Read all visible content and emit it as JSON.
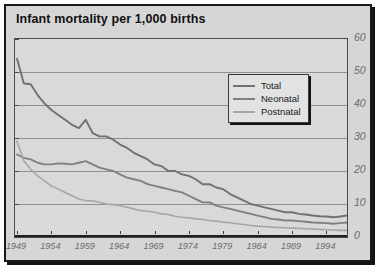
{
  "chart_data": {
    "type": "line",
    "title": "Infant mortality per 1,000 births",
    "xlabel": "",
    "ylabel": "",
    "ylim": [
      0,
      60
    ],
    "xlim": [
      1949,
      1997
    ],
    "yticks": [
      0,
      10,
      20,
      30,
      40,
      50,
      60
    ],
    "xticks": [
      1949,
      1954,
      1959,
      1964,
      1969,
      1974,
      1979,
      1984,
      1989,
      1994
    ],
    "grid": "horizontal",
    "legend_position": "upper-right-inside",
    "x": [
      1949,
      1950,
      1951,
      1952,
      1953,
      1954,
      1955,
      1956,
      1957,
      1958,
      1959,
      1960,
      1961,
      1962,
      1963,
      1964,
      1965,
      1966,
      1967,
      1968,
      1969,
      1970,
      1971,
      1972,
      1973,
      1974,
      1975,
      1976,
      1977,
      1978,
      1979,
      1980,
      1981,
      1982,
      1983,
      1984,
      1985,
      1986,
      1987,
      1988,
      1989,
      1990,
      1991,
      1992,
      1993,
      1994,
      1995,
      1996,
      1997
    ],
    "series": [
      {
        "name": "Total",
        "color": "#717171",
        "values": [
          54.0,
          46.5,
          46.3,
          43.0,
          40.5,
          38.5,
          37.0,
          35.5,
          34.0,
          33.0,
          35.5,
          31.5,
          30.5,
          30.5,
          29.5,
          28.0,
          27.0,
          25.5,
          24.5,
          23.5,
          22.0,
          21.5,
          20.0,
          20.0,
          19.0,
          18.5,
          17.5,
          16.0,
          16.0,
          15.0,
          14.5,
          13.0,
          12.0,
          11.0,
          10.0,
          9.5,
          9.0,
          8.5,
          8.0,
          7.5,
          7.5,
          7.0,
          6.8,
          6.5,
          6.3,
          6.2,
          6.0,
          6.2,
          6.5
        ]
      },
      {
        "name": "Neonatal",
        "color": "#808080",
        "values": [
          25.0,
          24.0,
          23.5,
          22.5,
          22.0,
          22.0,
          22.3,
          22.2,
          22.0,
          22.5,
          23.0,
          22.0,
          21.0,
          20.5,
          20.0,
          19.0,
          18.0,
          17.5,
          17.0,
          16.0,
          15.5,
          15.0,
          14.5,
          14.0,
          13.5,
          12.5,
          11.5,
          10.5,
          10.5,
          9.5,
          9.0,
          8.5,
          8.0,
          7.5,
          7.0,
          6.5,
          6.0,
          5.5,
          5.3,
          5.0,
          5.0,
          4.8,
          4.6,
          4.4,
          4.3,
          4.2,
          4.0,
          4.2,
          4.4
        ]
      },
      {
        "name": "Postnatal",
        "color": "#a6a6a6",
        "values": [
          29.0,
          23.0,
          20.5,
          18.5,
          17.0,
          15.5,
          14.5,
          13.5,
          12.5,
          11.5,
          11.0,
          11.0,
          10.5,
          10.0,
          9.8,
          9.5,
          9.0,
          8.5,
          8.0,
          7.8,
          7.5,
          7.0,
          6.8,
          6.3,
          6.0,
          5.8,
          5.5,
          5.3,
          5.0,
          4.8,
          4.5,
          4.3,
          4.0,
          3.8,
          3.5,
          3.3,
          3.2,
          3.0,
          2.9,
          2.8,
          2.7,
          2.6,
          2.5,
          2.4,
          2.3,
          2.2,
          2.1,
          2.0,
          2.0
        ]
      }
    ]
  },
  "legend": {
    "items": [
      {
        "label": "Total"
      },
      {
        "label": "Neonatal"
      },
      {
        "label": "Postnatal"
      }
    ]
  },
  "axes": {
    "y_tick_labels": [
      "60",
      "50",
      "40",
      "30",
      "20",
      "10",
      "0"
    ],
    "x_tick_labels": [
      "1949",
      "1954",
      "1959",
      "1964",
      "1969",
      "1974",
      "1979",
      "1984",
      "1989",
      "1994"
    ]
  },
  "colors": {
    "card_background": "#d6d6d6",
    "plot_background": "#d9d9d9",
    "border": "#1a1a1a",
    "gridline": "#8f8f8f",
    "tick_label": "#6b6b6b"
  }
}
